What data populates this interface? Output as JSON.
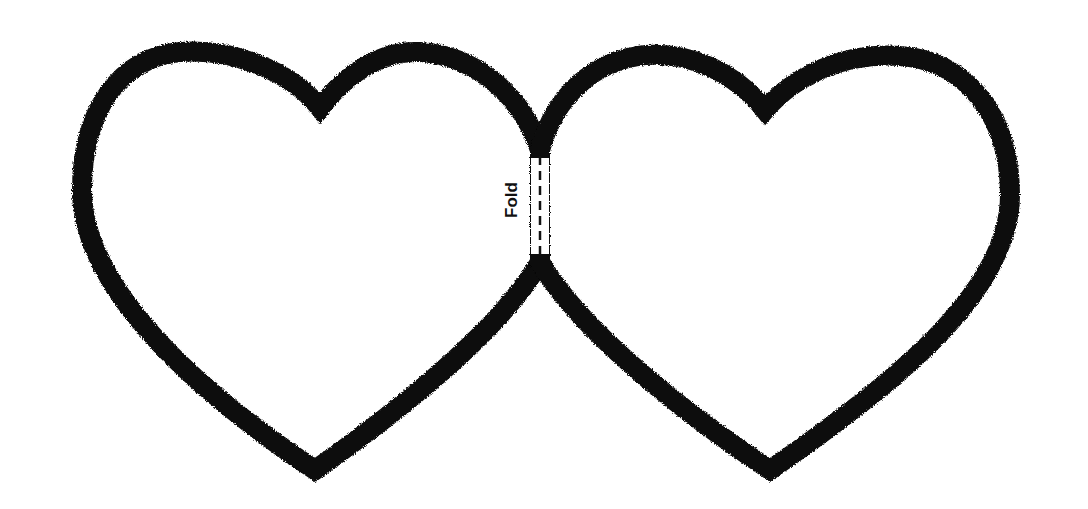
{
  "worksheet": {
    "fold_label": "Fold",
    "colors": {
      "outline": "#0a0a0a",
      "background": "#ffffff",
      "fold_line": "#111111"
    },
    "hearts": [
      {
        "name": "left-heart",
        "notch": [
          320,
          108
        ],
        "tip": [
          315,
          475
        ]
      },
      {
        "name": "right-heart",
        "notch": [
          765,
          110
        ],
        "tip": [
          770,
          475
        ]
      }
    ]
  }
}
